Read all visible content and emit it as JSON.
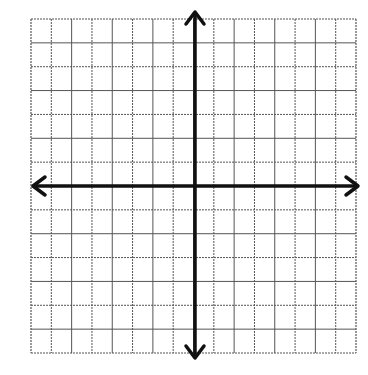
{
  "diagram": {
    "type": "coordinate-plane",
    "grid": {
      "columns": 16,
      "rows": 14,
      "left": 31,
      "top": 19,
      "right": 356,
      "bottom": 353,
      "line_color": "#555555"
    },
    "axes": {
      "x_axis_y": 186,
      "y_axis_x": 195,
      "x_start": 33,
      "x_end": 358,
      "y_start": 12,
      "y_end": 358,
      "color": "#111111",
      "width": 3.5
    },
    "labels": []
  }
}
